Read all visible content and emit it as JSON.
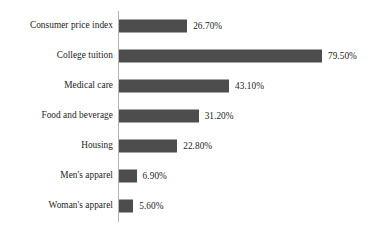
{
  "chart_data": {
    "type": "bar",
    "orientation": "horizontal",
    "title": "",
    "subtitle": "",
    "xlabel": "",
    "ylabel": "",
    "grid": false,
    "legend": false,
    "axis_line": "vertical-category-axis",
    "xlim": [
      0,
      79.5
    ],
    "categories": [
      "Consumer price index",
      "College tuition",
      "Medical care",
      "Food and beverage",
      "Housing",
      "Men's apparel",
      "Woman's apparel"
    ],
    "values": [
      26.7,
      79.5,
      43.1,
      31.2,
      22.8,
      6.9,
      5.6
    ],
    "value_labels": [
      "26.70%",
      "79.50%",
      "43.10%",
      "31.20%",
      "22.80%",
      "6.90%",
      "5.60%"
    ],
    "bar_color": "#4d4d4d",
    "axis_color": "#b3b3b3",
    "text_color": "#1c1c1c",
    "background_color": "#ffffff"
  }
}
